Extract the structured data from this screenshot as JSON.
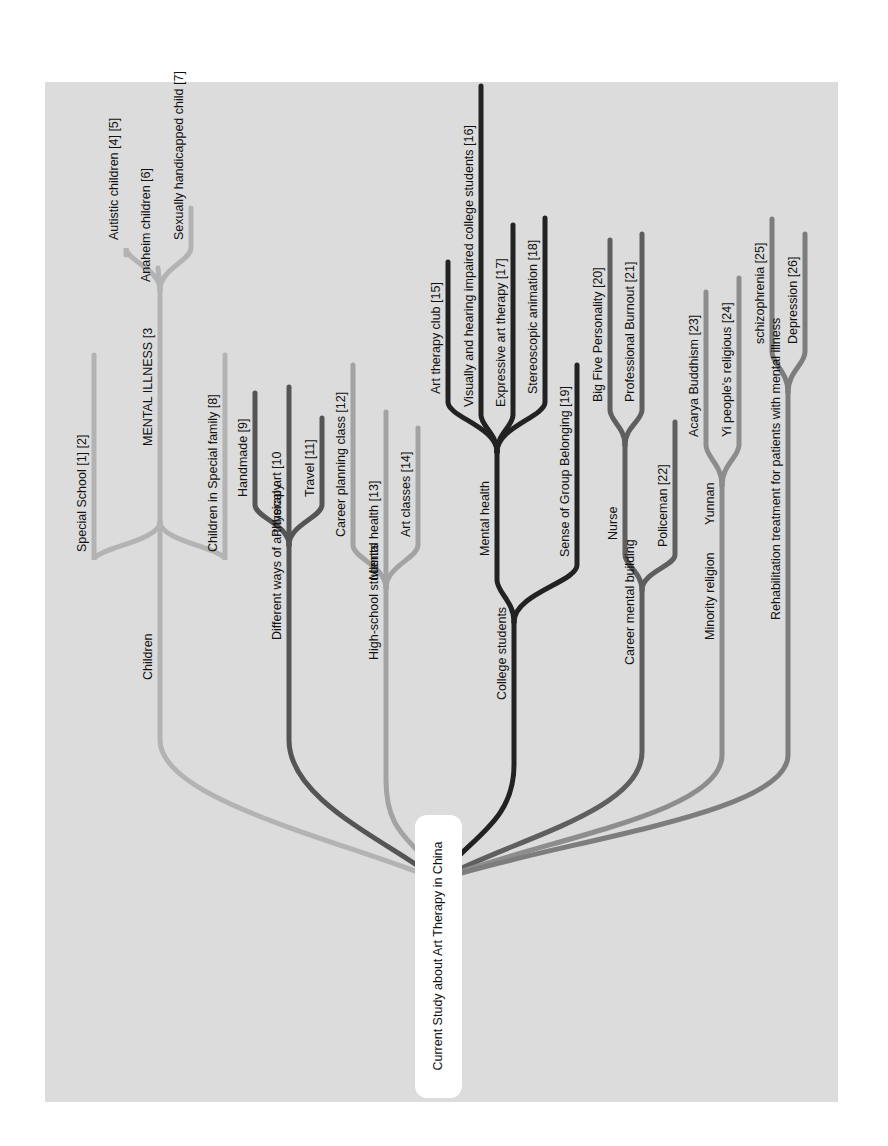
{
  "figure": {
    "title": "Current Study about Art Therapy in China",
    "background_color": "#dcdcdc",
    "root_box_color": "#ffffff"
  },
  "root": {
    "label": "Current Study about Art Therapy in China",
    "anchor": [
      438,
      880
    ]
  },
  "branches": [
    {
      "label": "Children",
      "color": "#b3b3b3",
      "width": 5,
      "trunk_x": 160,
      "bend_y": 740,
      "fork_y": 522,
      "label_y": 680,
      "children": [
        {
          "label": "Special School [1] [2]",
          "x": 94,
          "top": 355,
          "bend": 560
        },
        {
          "label": "MENTAL ILLNESS [3",
          "x": 160,
          "top": 290,
          "bend": null,
          "fork_y": 290,
          "children": [
            {
              "label": "Autistic children [4] [5]",
              "x": 126,
              "top": 255,
              "bend": 248
            },
            {
              "label": "Anaheim children [6]",
              "x": 158,
              "top": 268,
              "bend": null
            },
            {
              "label": "Sexually handicapped child [7]",
              "x": 191,
              "top": 208,
              "bend": 248
            }
          ]
        },
        {
          "label": "Children in Special family [8]",
          "x": 225,
          "top": 355,
          "bend": 560
        }
      ]
    },
    {
      "label": "Different ways of art therapy",
      "color": "#555555",
      "width": 5,
      "trunk_x": 289,
      "bend_y": 740,
      "fork_y": 545,
      "label_y": 640,
      "children": [
        {
          "label": "Handmade [9]",
          "x": 255,
          "top": 393,
          "bend": 505
        },
        {
          "label": "Physical art [10",
          "x": 289,
          "top": 387,
          "bend": null
        },
        {
          "label": "Travel [11]",
          "x": 322,
          "top": 418,
          "bend": 505
        }
      ]
    },
    {
      "label": "High-school students",
      "color": "#a3a3a3",
      "width": 5,
      "trunk_x": 386,
      "bend_y": 780,
      "fork_y": 588,
      "label_y": 660,
      "children": [
        {
          "label": "Career planning class [12]",
          "x": 353,
          "top": 365,
          "bend": 545
        },
        {
          "label": "Mental health [13]",
          "x": 386,
          "top": 412,
          "bend": null
        },
        {
          "label": "Art classes [14]",
          "x": 418,
          "top": 428,
          "bend": 545
        }
      ]
    },
    {
      "label": "College students",
      "color": "#222222",
      "width": 5,
      "trunk_x": 514,
      "bend_y": 765,
      "fork_y": 622,
      "label_y": 700,
      "children": [
        {
          "label": "Mental health",
          "x": 497,
          "top": 452,
          "bend": 580,
          "fork_y": 452,
          "children": [
            {
              "label": "Art therapy club [15]",
              "x": 448,
              "top": 262,
              "bend": 402
            },
            {
              "label": "Visually and hearing impaired college students [16]",
              "x": 481,
              "top": 86,
              "bend": 415
            },
            {
              "label": "Expressive art therapy [17]",
              "x": 513,
              "top": 225,
              "bend": 415
            },
            {
              "label": "Stereoscopic animation [18]",
              "x": 545,
              "top": 218,
              "bend": 402
            }
          ]
        },
        {
          "label": "Sense of Group Belonging [19]",
          "x": 577,
          "top": 365,
          "bend": 565
        }
      ]
    },
    {
      "label": "Career mental building",
      "color": "#5f5f5f",
      "width": 5,
      "trunk_x": 642,
      "bend_y": 752,
      "fork_y": 590,
      "label_y": 665,
      "children": [
        {
          "label": "Nurse",
          "x": 625,
          "top": 445,
          "bend": 555,
          "fork_y": 445,
          "children": [
            {
              "label": "Big Five Personality [20]",
              "x": 610,
              "top": 240,
              "bend": 410
            },
            {
              "label": "Professional Burnout [21]",
              "x": 642,
              "top": 234,
              "bend": 410
            }
          ]
        },
        {
          "label": "Policeman [22]",
          "x": 675,
          "top": 422,
          "bend": 555
        }
      ]
    },
    {
      "label": "Minority religion",
      "color": "#8d8d8d",
      "width": 5,
      "trunk_x": 722,
      "bend_y": 755,
      "fork_y": 485,
      "label_y": 640,
      "children": [
        {
          "label": "Yunnan",
          "x": 722,
          "top": 485,
          "bend": null,
          "fork_y": 485,
          "children": [
            {
              "label": "Acarya Buddhism [23]",
              "x": 706,
              "top": 292,
              "bend": 445
            },
            {
              "label": "Yi people's religious [24]",
              "x": 739,
              "top": 278,
              "bend": 445
            }
          ]
        }
      ]
    },
    {
      "label": "Rehabilitation treatment for patients with mental illness",
      "color": "#7d7d7d",
      "width": 5,
      "trunk_x": 788,
      "bend_y": 755,
      "fork_y": 392,
      "label_y": 620,
      "children": [
        {
          "label": "schizophrenia [25]",
          "x": 772,
          "top": 219,
          "bend": 352
        },
        {
          "label": "Depression [26]",
          "x": 805,
          "top": 234,
          "bend": 352
        }
      ]
    }
  ]
}
